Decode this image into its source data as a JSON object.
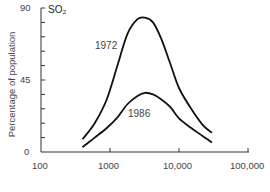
{
  "chart_data": {
    "type": "line",
    "xlabel": "",
    "ylabel": "Percentage of population",
    "xscale": "log",
    "xlim": [
      100,
      100000
    ],
    "ylim": [
      0,
      90
    ],
    "x_ticks": [
      "100",
      "1000",
      "10,000",
      "100,000"
    ],
    "y_ticks": [
      "0",
      "45",
      "90"
    ],
    "grid": false,
    "legend": "inline labels",
    "series": [
      {
        "name": "1972",
        "x": [
          400,
          600,
          900,
          1300,
          1800,
          2500,
          3200,
          4200,
          5500,
          7500,
          10000,
          15000,
          22000,
          30000
        ],
        "values": [
          8,
          18,
          33,
          55,
          74,
          83,
          84,
          81,
          71,
          55,
          40,
          27,
          17,
          12
        ]
      },
      {
        "name": "1986",
        "x": [
          400,
          600,
          900,
          1300,
          1800,
          2500,
          3200,
          4200,
          5500,
          7500,
          10000,
          15000,
          22000,
          30000
        ],
        "values": [
          3,
          9,
          15,
          22,
          30,
          35,
          37,
          36,
          33,
          28,
          21,
          15,
          10,
          6
        ]
      }
    ]
  },
  "labels": {
    "so2": "SO₂",
    "ylabel": "Percentage of population",
    "series_1972": "1972",
    "series_1986": "1986",
    "x_ticks": [
      "100",
      "1000",
      "10,000",
      "100,000"
    ],
    "y_ticks": [
      "90",
      "45",
      "0"
    ]
  }
}
